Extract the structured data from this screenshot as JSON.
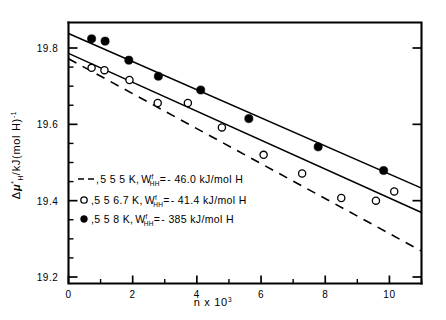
{
  "chart_data": {
    "type": "scatter",
    "title": "",
    "xlabel": "n x 10³",
    "ylabel": "Δμ*H /kJ(mol H)⁻¹",
    "xlim": [
      0,
      11
    ],
    "ylim": [
      19.2,
      19.86
    ],
    "grid": false,
    "legend_position": "inside-lower-left",
    "xticks": [
      "0",
      "2",
      "4",
      "6",
      "8",
      "10"
    ],
    "xtick_values": [
      0,
      2,
      4,
      6,
      8,
      10
    ],
    "yticks": [
      "19.8",
      "19.6",
      "19.4",
      "19.2"
    ],
    "ytick_values": [
      19.8,
      19.6,
      19.4,
      19.2
    ],
    "xminor_values": [
      1,
      3,
      5,
      7,
      9,
      11
    ],
    "yminor_values": [
      19.75,
      19.7,
      19.65,
      19.55,
      19.5,
      19.45,
      19.35,
      19.3,
      19.25
    ],
    "series": [
      {
        "name": "555 K",
        "marker": "dashed-line-only",
        "temperature": "555 K",
        "w_hh": "-46.0 kJ/mol H",
        "legend_label": ", 5 5 5 K, W",
        "legend_sub": "HH",
        "legend_sup": "f",
        "legend_tail": "= - 46.0 kJ/mol H",
        "line": {
          "style": "dashed",
          "x0": 0,
          "y0": 19.772,
          "x1": 11,
          "y1": 19.268
        },
        "values": []
      },
      {
        "name": "556.7 K",
        "marker": "open-circle",
        "temperature": "556.7 K",
        "w_hh": "-41.4 kJ/mol H",
        "legend_label": ", 5 5 6.7 K, W",
        "legend_sub": "HH",
        "legend_sup": "f",
        "legend_tail": "= - 41.4 kJ/mol H",
        "line": {
          "style": "solid",
          "x0": 0,
          "y0": 19.786,
          "x1": 11,
          "y1": 19.369
        },
        "x": [
          0.72,
          1.12,
          1.9,
          2.78,
          3.72,
          4.78,
          6.08,
          7.28,
          8.5,
          9.58,
          10.15
        ],
        "y": [
          19.748,
          19.742,
          19.716,
          19.656,
          19.656,
          19.592,
          19.52,
          19.471,
          19.407,
          19.4,
          19.424
        ]
      },
      {
        "name": "558 K",
        "marker": "filled-circle",
        "temperature": "558 K",
        "w_hh": "-385 kJ/mol H",
        "legend_label": ", 5 5 8 K, W",
        "legend_sub": "HH",
        "legend_sup": "f",
        "legend_tail": "= - 385 kJ/mol H",
        "line": {
          "style": "solid",
          "x0": 0,
          "y0": 19.838,
          "x1": 11,
          "y1": 19.433
        },
        "x": [
          0.72,
          1.14,
          1.88,
          2.8,
          4.12,
          5.62,
          7.78,
          9.82
        ],
        "y": [
          19.824,
          19.818,
          19.768,
          19.726,
          19.69,
          19.615,
          19.541,
          19.479
        ]
      }
    ]
  },
  "axes": {
    "x_axis_label": "n x 10",
    "x_axis_exponent": "3",
    "y_axis_delta": "Δ",
    "y_axis_mu": "μ",
    "y_axis_mu_sub": "H",
    "y_axis_mu_sup": "*",
    "y_axis_rest": "/kJ(mol H)",
    "y_axis_exponent": "-1"
  },
  "legend": {
    "entries": [
      {
        "marker": "dashed",
        "prefix": ",",
        "temp": "5 5 5 K,",
        "symbol": "W",
        "sub": "HH",
        "sup": "f",
        "equals": "=",
        "value": "- 46.0 kJ/mol H"
      },
      {
        "marker": "open-circle",
        "prefix": "o,",
        "temp": "5 5 6.7 K,",
        "symbol": "W",
        "sub": "HH",
        "sup": "f",
        "equals": "=",
        "value": "- 41.4 kJ/mol H"
      },
      {
        "marker": "filled-circle",
        "prefix": "●,",
        "temp": "5 5 8 K,",
        "symbol": "W",
        "sub": "HH",
        "sup": "f",
        "equals": "=",
        "value": "- 385 kJ/mol H"
      }
    ]
  },
  "colors": {
    "ink": "#000000",
    "background": "#ffffff"
  }
}
